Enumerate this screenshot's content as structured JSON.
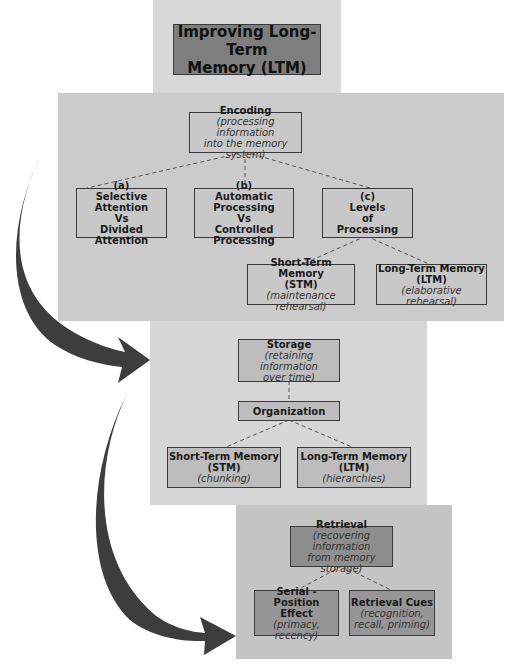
{
  "title": {
    "line1": "Improving Long-Term",
    "line2": "Memory (LTM)"
  },
  "encoding": {
    "heading": "Encoding",
    "desc1": "(processing information",
    "desc2": "into the memory system)",
    "children": [
      {
        "label": "(a)",
        "line1": "Selective Attention",
        "line2": "Vs",
        "line3": "Divided Attention"
      },
      {
        "label": "(b)",
        "line1": "Automatic Processing",
        "line2": "Vs",
        "line3": "Controlled Processing"
      },
      {
        "label": "(c)",
        "line1": "Levels",
        "line2": "of",
        "line3": "Processing"
      }
    ],
    "levels": [
      {
        "line1": "Short-Term Memory",
        "line2": "(STM)",
        "desc": "(maintenance rehearsal)"
      },
      {
        "line1": "Long-Term Memory",
        "line2": "(LTM)",
        "desc": "(elaborative rehearsal)"
      }
    ]
  },
  "storage": {
    "heading": "Storage",
    "desc1": "(retaining information",
    "desc2": "over time)",
    "organization": "Organization",
    "children": [
      {
        "line1": "Short-Term Memory",
        "line2": "(STM)",
        "desc": "(chunking)"
      },
      {
        "line1": "Long-Term Memory",
        "line2": "(LTM)",
        "desc": "(hierarchies)"
      }
    ]
  },
  "retrieval": {
    "heading": "Retrieval",
    "desc1": "(recovering information",
    "desc2": "from memory storage)",
    "children": [
      {
        "line1": "Serial -Position",
        "line2": "Effect",
        "desc1": "(primacy, recency)"
      },
      {
        "line1": "Retrieval Cues",
        "desc1": "(recognition,",
        "desc2": "recall, priming)"
      }
    ]
  },
  "colors": {
    "arrow": "#3d3d3d",
    "connector": "#555555"
  }
}
